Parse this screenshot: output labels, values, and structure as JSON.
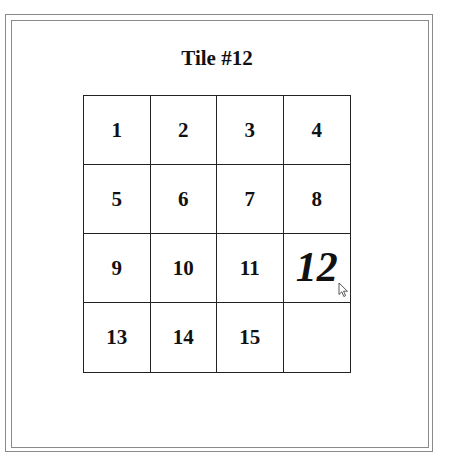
{
  "title": "Tile #12",
  "puzzle": {
    "rows": 4,
    "cols": 4,
    "selected_tile": "12",
    "tiles": [
      {
        "label": "1"
      },
      {
        "label": "2"
      },
      {
        "label": "3"
      },
      {
        "label": "4"
      },
      {
        "label": "5"
      },
      {
        "label": "6"
      },
      {
        "label": "7"
      },
      {
        "label": "8"
      },
      {
        "label": "9"
      },
      {
        "label": "10"
      },
      {
        "label": "11"
      },
      {
        "label": "12",
        "selected": true
      },
      {
        "label": "13"
      },
      {
        "label": "14"
      },
      {
        "label": "15"
      },
      {
        "label": "",
        "empty": true
      }
    ]
  },
  "colors": {
    "frame_border": "#8a8a8a",
    "grid_line": "#222222",
    "text": "#111111",
    "background": "#ffffff"
  },
  "cursor": {
    "icon": "arrow-pointer-icon",
    "x": 338,
    "y": 282
  }
}
